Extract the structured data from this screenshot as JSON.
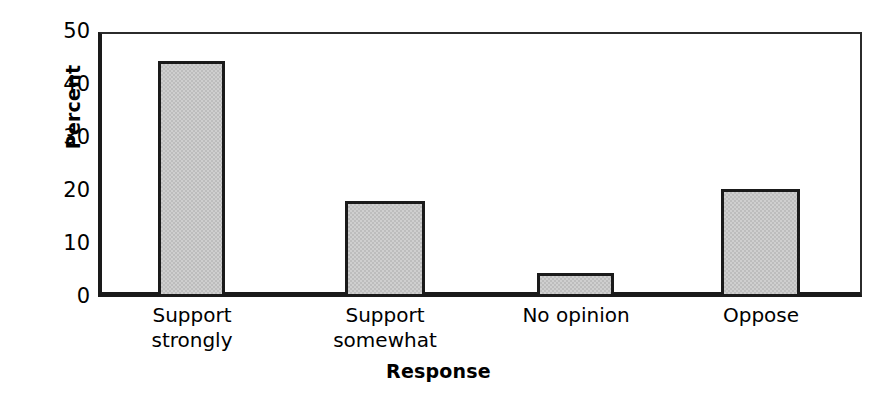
{
  "chart_data": {
    "type": "bar",
    "title": "",
    "xlabel": "Response",
    "ylabel": "Percent",
    "categories": [
      "Support strongly",
      "Support somewhat",
      "No opinion",
      "Oppose"
    ],
    "category_lines": [
      [
        "Support",
        "strongly"
      ],
      [
        "Support",
        "somewhat"
      ],
      [
        "No opinion",
        ""
      ],
      [
        "Oppose",
        ""
      ]
    ],
    "values": [
      44.6,
      18.2,
      4.6,
      20.3
    ],
    "ylim": [
      0,
      50
    ],
    "yticks": [
      0,
      10,
      20,
      30,
      40,
      50
    ],
    "ytick_labels": [
      "0",
      "10",
      "20",
      "30",
      "40",
      "50"
    ],
    "grid": false,
    "legend": false,
    "legend_position": "none",
    "bar_fill_color": "#cfcfcf",
    "bar_edge_color": "#1a1a1a",
    "axis_color": "#1a1a1a",
    "background_color": "#ffffff"
  }
}
